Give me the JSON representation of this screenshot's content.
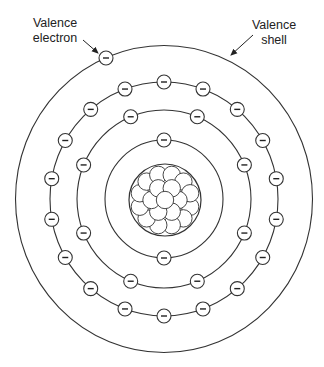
{
  "labels": {
    "valence_electron": {
      "line1": "Valence",
      "line2": "electron"
    },
    "valence_shell": {
      "line1": "Valence",
      "line2": "shell"
    }
  },
  "diagram": {
    "center": [
      164,
      199
    ],
    "stroke_color": "#333333",
    "electron_symbol": "−",
    "nucleus": {
      "radius": 36,
      "particle_radius": 7.2,
      "particle_count": 19
    },
    "shells": [
      {
        "name": "shell-1",
        "rx": 59,
        "ry": 59,
        "electrons": 2,
        "start_angle": 90,
        "step": 180
      },
      {
        "name": "shell-2",
        "rx": 87,
        "ry": 89,
        "electrons": 8,
        "start_angle": 22.5,
        "step": 45
      },
      {
        "name": "shell-3",
        "rx": 114,
        "ry": 117,
        "electrons": 18,
        "start_angle": 10,
        "step": 20
      },
      {
        "name": "valence-shell",
        "rx": 148.5,
        "ry": 153.5,
        "electrons": 1,
        "electron_positions": [
          [
            106,
            58
          ]
        ]
      }
    ],
    "electron_radius": 7
  }
}
